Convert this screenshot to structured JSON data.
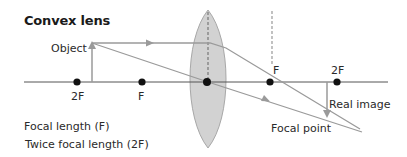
{
  "title": "Convex lens",
  "labels": {
    "object": "Object",
    "left_2f": "2F",
    "left_f": "F",
    "right_f": "F",
    "right_2f": "2F",
    "real_image": "Real image",
    "focal_point": "Focal point"
  },
  "legend": {
    "focal_length": "Focal length (F)",
    "twice_focal_length": "Twice focal length (2F)"
  },
  "colors": {
    "axis": "#555555",
    "ray": "#9a9a9a",
    "lens_fill": "#d0d0d0",
    "lens_stroke": "#a8a8a8",
    "dot": "#111111"
  }
}
